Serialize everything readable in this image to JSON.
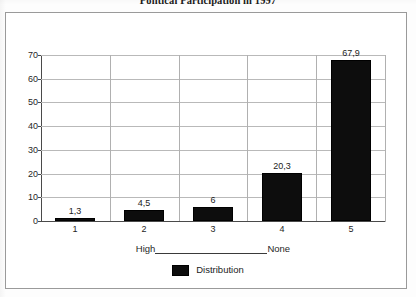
{
  "title": "Political Participation in 1997",
  "axis_caption": {
    "left": "High",
    "right": "None"
  },
  "legend": {
    "entries": [
      {
        "label": "Distribution",
        "color": "#0d0d0d"
      }
    ]
  },
  "colors": {
    "bar": "#0d0d0d",
    "grid": "#b9b9b9",
    "axis": "#4a4a4a",
    "frame": "#9a9a9a",
    "text": "#1b1b1b",
    "background": "#ffffff"
  },
  "chart_data": {
    "type": "bar",
    "title": "Political Participation in 1997",
    "xlabel": "High                    None",
    "ylabel": "",
    "categories": [
      "1",
      "2",
      "3",
      "4",
      "5"
    ],
    "values": [
      1.3,
      4.5,
      6,
      20.3,
      67.9
    ],
    "value_labels": [
      "1,3",
      "4,5",
      "6",
      "20,3",
      "67,9"
    ],
    "series": [
      {
        "name": "Distribution",
        "values": [
          1.3,
          4.5,
          6,
          20.3,
          67.9
        ]
      }
    ],
    "ylim": [
      0,
      70
    ],
    "ytick_step": 10,
    "ytick_labels": [
      "0",
      "10",
      "20",
      "30",
      "40",
      "50",
      "60",
      "70"
    ],
    "grid": true,
    "grid_orientation": "both",
    "legend_position": "bottom",
    "decimal_separator": ","
  }
}
